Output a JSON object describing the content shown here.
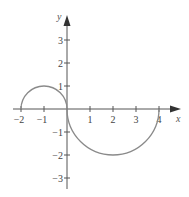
{
  "chart_data": {
    "type": "line",
    "title": "",
    "xlabel": "x",
    "ylabel": "y",
    "xlim": [
      -2,
      4
    ],
    "ylim": [
      -3,
      3
    ],
    "grid": false,
    "legend": "none",
    "x_ticks": [
      -2,
      -1,
      1,
      2,
      3,
      4
    ],
    "x_tick_labels": [
      "−2",
      "−1",
      "1",
      "2",
      "3",
      "4"
    ],
    "y_ticks": [
      3,
      2,
      1,
      -1,
      -2,
      -3
    ],
    "y_tick_labels": [
      "3",
      "2",
      "1",
      "−1",
      "−2",
      "−3"
    ],
    "series": [
      {
        "name": "upper semicircle",
        "shape": "semicircle",
        "center": [
          -1,
          0
        ],
        "radius": 1,
        "side": "upper",
        "x_range": [
          -2,
          0
        ],
        "color": "#8a8a8a"
      },
      {
        "name": "lower semicircle",
        "shape": "semicircle",
        "center": [
          2,
          0
        ],
        "radius": 2,
        "side": "lower",
        "x_range": [
          0,
          4
        ],
        "color": "#8a8a8a"
      }
    ]
  }
}
